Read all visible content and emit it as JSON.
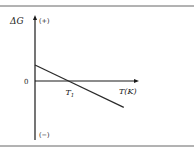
{
  "chart_data": {
    "type": "line",
    "title": "",
    "ylabel": "ΔG",
    "xlabel": "T(K)",
    "y_positive_label": "(+)",
    "y_negative_label": "(−)",
    "origin_label": "0",
    "x_marker_label": "T",
    "x_marker_subscript": "1",
    "series": [
      {
        "name": "ΔG vs T",
        "points": [
          {
            "x": 0,
            "y": 1
          },
          {
            "x": 1,
            "y": 0
          },
          {
            "x": 2.65,
            "y": -1.65
          }
        ]
      }
    ],
    "xlim": [
      0,
      3.1
    ],
    "ylim": [
      -2.6,
      3.2
    ],
    "grid": false,
    "colors": {
      "line": "#2a2a2a",
      "axis": "#1a1a1a",
      "border": "#555555"
    }
  }
}
